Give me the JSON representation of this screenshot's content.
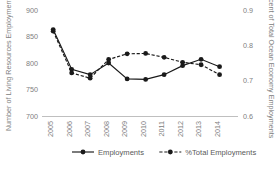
{
  "chart_data": {
    "type": "line",
    "title": "",
    "xlabel": "",
    "ylabel": "Number of Living Resources Employments",
    "y2label": "Percent of Total Ocean Economy Employments",
    "categories": [
      "2005",
      "2006",
      "2007",
      "2008",
      "2009",
      "2010",
      "2011",
      "2012",
      "2013",
      "2014"
    ],
    "x_tick_labels": [
      "2005",
      "2006",
      "2007",
      "2008",
      "2009",
      "2010",
      "2011",
      "2012",
      "2013",
      "2014"
    ],
    "y_tick_labels": [
      "700",
      "750",
      "800",
      "850",
      "900"
    ],
    "y2_tick_labels": [
      "0.6",
      "0.7",
      "0.8",
      "0.9"
    ],
    "ylim": [
      700,
      900
    ],
    "y2lim": [
      0.6,
      0.9
    ],
    "grid": false,
    "legend_position": "bottom",
    "series": [
      {
        "name": "Employments",
        "axis": "left",
        "style": "solid",
        "marker": "circle",
        "values": [
          863,
          788,
          778,
          800,
          770,
          769,
          778,
          795,
          807,
          793
        ]
      },
      {
        "name": "%Total Employments",
        "axis": "right",
        "style": "dashed",
        "marker": "circle",
        "values": [
          0.84,
          0.722,
          0.707,
          0.76,
          0.776,
          0.777,
          0.766,
          0.752,
          0.745,
          0.717
        ]
      }
    ]
  },
  "legend": {
    "items": [
      {
        "label": "Employments",
        "style": "solid"
      },
      {
        "label": "%Total Employments",
        "style": "dashed"
      }
    ]
  },
  "axes": {
    "left_title": "Number of Living Resources Employments",
    "right_title": "Percent of Total Ocean Economy Employments"
  }
}
